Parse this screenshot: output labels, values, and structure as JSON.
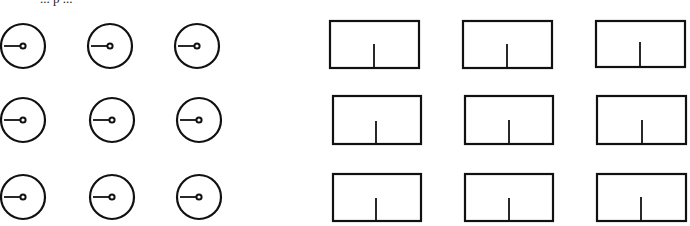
{
  "caption": "... p ...",
  "colors": {
    "stroke": "#111111",
    "background": "#ffffff"
  },
  "left_panel": {
    "type": "circular-dials",
    "rows": 3,
    "cols": 3,
    "items": [
      {
        "cx": 23,
        "cy": 46,
        "r": 22,
        "pointer": "left"
      },
      {
        "cx": 110,
        "cy": 46,
        "r": 22,
        "pointer": "left"
      },
      {
        "cx": 197,
        "cy": 46,
        "r": 22,
        "pointer": "left"
      },
      {
        "cx": 23,
        "cy": 120,
        "r": 22,
        "pointer": "left"
      },
      {
        "cx": 112,
        "cy": 120,
        "r": 22,
        "pointer": "left"
      },
      {
        "cx": 199,
        "cy": 120,
        "r": 22,
        "pointer": "left"
      },
      {
        "cx": 23,
        "cy": 197,
        "r": 22,
        "pointer": "left"
      },
      {
        "cx": 112,
        "cy": 197,
        "r": 22,
        "pointer": "left"
      },
      {
        "cx": 199,
        "cy": 197,
        "r": 22,
        "pointer": "left"
      }
    ]
  },
  "right_panel": {
    "type": "rectangular-gauges",
    "rows": 3,
    "cols": 3,
    "items": [
      {
        "x": 330,
        "y": 21,
        "w": 89,
        "h": 47,
        "tick_x": 374,
        "tick_top": 44
      },
      {
        "x": 463,
        "y": 21,
        "w": 89,
        "h": 47,
        "tick_x": 507,
        "tick_top": 44
      },
      {
        "x": 596,
        "y": 21,
        "w": 89,
        "h": 46,
        "tick_x": 640,
        "tick_top": 42
      },
      {
        "x": 333,
        "y": 96,
        "w": 88,
        "h": 48,
        "tick_x": 376,
        "tick_top": 121
      },
      {
        "x": 465,
        "y": 96,
        "w": 88,
        "h": 48,
        "tick_x": 509,
        "tick_top": 120
      },
      {
        "x": 597,
        "y": 96,
        "w": 89,
        "h": 48,
        "tick_x": 642,
        "tick_top": 120
      },
      {
        "x": 333,
        "y": 174,
        "w": 88,
        "h": 47,
        "tick_x": 376,
        "tick_top": 198
      },
      {
        "x": 465,
        "y": 174,
        "w": 88,
        "h": 47,
        "tick_x": 509,
        "tick_top": 198
      },
      {
        "x": 597,
        "y": 174,
        "w": 89,
        "h": 47,
        "tick_x": 641,
        "tick_top": 197
      }
    ]
  }
}
